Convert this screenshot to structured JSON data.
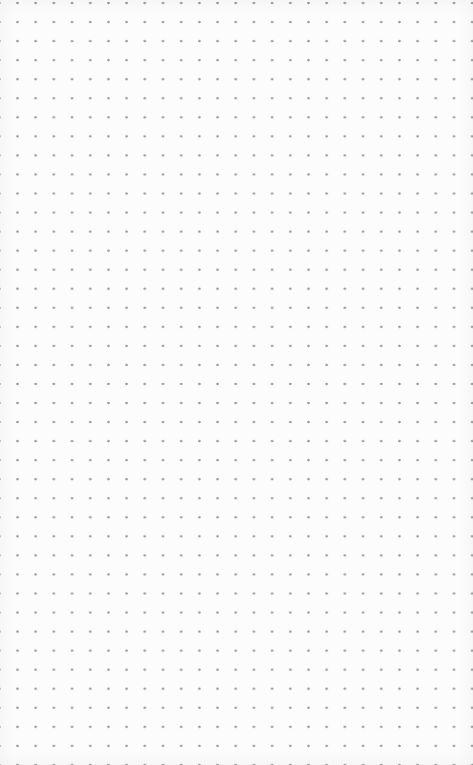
{
  "page": {
    "type": "dot-grid-paper",
    "background_color": "#fcfcfc",
    "dot_color": "#9a9a9a",
    "dot_spacing_x_px": 18.2,
    "dot_spacing_y_px": 19.05,
    "columns": 26,
    "rows": 40
  }
}
